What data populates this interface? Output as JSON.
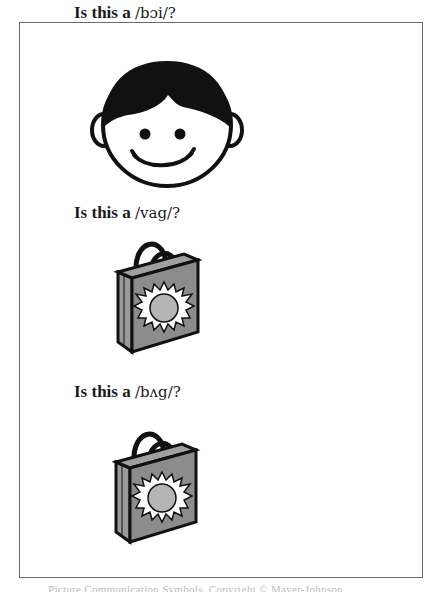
{
  "document": {
    "items": [
      {
        "prefix": "Is this a",
        "ipa": "/bɔi/?",
        "image": "boy-face-icon"
      },
      {
        "prefix": "Is this a",
        "ipa": "/vag/?",
        "image": "shopping-bag-icon"
      },
      {
        "prefix": "Is this a",
        "ipa": "/bʌg/?",
        "image": "shopping-bag-icon"
      }
    ],
    "footer": "Picture Communication Symbols. Copyright © Mayer-Johnson"
  },
  "colors": {
    "frame": "#6a6a6a",
    "hair": "#111111",
    "bag_body": "#8c8c8c",
    "bag_sun_center": "#b5b5b5",
    "outline": "#1a1a1a"
  }
}
